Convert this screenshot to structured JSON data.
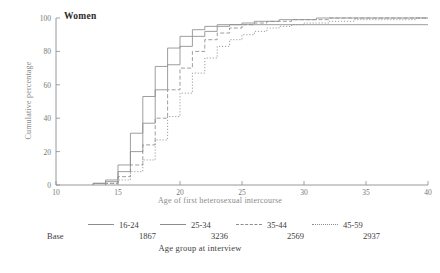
{
  "chart_data": {
    "type": "line",
    "title": "Women",
    "xlabel": "Age of first heterosexual intercourse",
    "ylabel": "Cumulative percentage",
    "legend_title": "Age group at interview",
    "base_label": "Base",
    "xlim": [
      10,
      40
    ],
    "ylim": [
      0,
      100
    ],
    "xticks": [
      10,
      15,
      20,
      25,
      30,
      35,
      40
    ],
    "yticks": [
      0,
      20,
      40,
      60,
      80,
      100
    ],
    "grid": false,
    "legend_position": "below-axes",
    "series": [
      {
        "name": "16-24",
        "base": "1867",
        "linestyle": "solid",
        "x": [
          13,
          14,
          15,
          16,
          17,
          18,
          19,
          20,
          21,
          22,
          23,
          24
        ],
        "values": [
          1,
          3,
          12,
          31,
          53,
          71,
          82,
          89,
          93,
          95,
          96,
          96
        ]
      },
      {
        "name": "25-34",
        "base": "3236",
        "linestyle": "solid",
        "x": [
          13,
          14,
          15,
          16,
          17,
          18,
          19,
          20,
          21,
          22,
          23,
          24,
          25,
          26,
          27,
          28,
          29,
          30,
          31,
          32,
          33,
          34
        ],
        "values": [
          1,
          2,
          8,
          20,
          37,
          57,
          72,
          83,
          89,
          92,
          95,
          96,
          97,
          98,
          98,
          99,
          99,
          99,
          100,
          100,
          100,
          100
        ]
      },
      {
        "name": "35-44",
        "base": "2569",
        "linestyle": "dashed",
        "x": [
          14,
          15,
          16,
          17,
          18,
          19,
          20,
          21,
          22,
          23,
          24,
          25,
          26,
          27,
          28,
          29,
          30,
          31,
          32,
          33,
          34,
          35
        ],
        "values": [
          1,
          5,
          12,
          24,
          40,
          57,
          70,
          80,
          87,
          91,
          94,
          96,
          97,
          98,
          98,
          99,
          99,
          99,
          100,
          100,
          100,
          100
        ]
      },
      {
        "name": "45-59",
        "base": "2937",
        "linestyle": "dotted",
        "x": [
          14,
          15,
          16,
          17,
          18,
          19,
          20,
          21,
          22,
          23,
          24,
          25,
          26,
          27,
          28,
          29,
          30,
          31,
          32,
          33,
          34,
          35,
          36,
          37,
          38,
          39,
          40
        ],
        "values": [
          1,
          3,
          8,
          15,
          27,
          41,
          55,
          67,
          76,
          83,
          87,
          90,
          92,
          94,
          95,
          96,
          97,
          97,
          98,
          98,
          99,
          99,
          99,
          99,
          99,
          100,
          100
        ]
      }
    ]
  },
  "legend": {
    "items": [
      {
        "label": "16-24",
        "base": "1867"
      },
      {
        "label": "25-34",
        "base": "3236"
      },
      {
        "label": "35-44",
        "base": "2569"
      },
      {
        "label": "45-59",
        "base": "2937"
      }
    ],
    "base_label": "Base",
    "caption": "Age group at interview"
  },
  "colors": {
    "axis": "#8d8d8d",
    "line": "#8d8d8d",
    "text": "#3d3d3d",
    "muted": "#8a8a8a",
    "background": "#ffffff"
  }
}
